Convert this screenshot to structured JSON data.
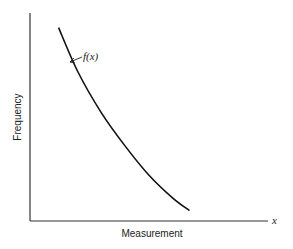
{
  "chart_data": {
    "type": "line",
    "title": "",
    "xlabel": "Measurement",
    "ylabel": "Frequency",
    "x_axis_symbol": "x",
    "grid": false,
    "legend": "none",
    "xlim": [
      0,
      1
    ],
    "ylim": [
      0,
      1
    ],
    "series": [
      {
        "name": "f(x)",
        "annotation": "f(x)",
        "description": "decreasing convex curve (exponential-like decay)",
        "x": [
          0.12,
          0.2,
          0.3,
          0.4,
          0.5,
          0.6,
          0.67
        ],
        "y": [
          0.93,
          0.72,
          0.52,
          0.36,
          0.22,
          0.11,
          0.05
        ]
      }
    ]
  }
}
